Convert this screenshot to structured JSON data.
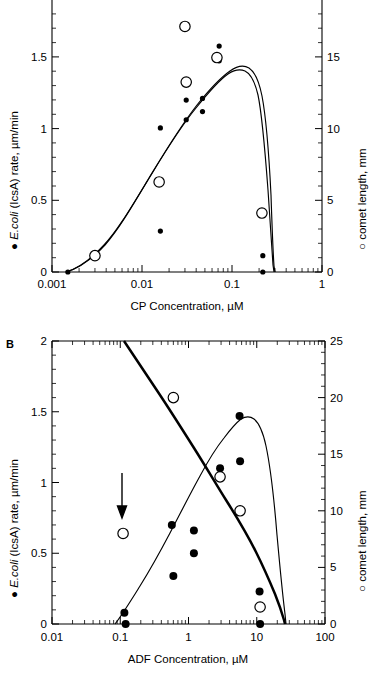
{
  "figure": {
    "panels": [
      {
        "letter": "",
        "id": "panel-a",
        "xlabel": "CP Concentration, µM",
        "ylabel_left_marker": "●",
        "ylabel_left_italic": "E.coli",
        "ylabel_left_rest": " (IcsA) rate,  µm/min",
        "ylabel_right_marker": "○",
        "ylabel_right_text": " comet length, mm",
        "x_ticks": [
          "0.001",
          "0.01",
          "0.1",
          "1"
        ],
        "y_left_ticks": [
          "0",
          "0.5",
          "1",
          "1.5"
        ],
        "y_right_ticks": [
          "0",
          "5",
          "10",
          "15"
        ]
      },
      {
        "letter": "B",
        "id": "panel-b",
        "xlabel": "ADF Concentration, µM",
        "ylabel_left_marker": "●",
        "ylabel_left_italic": "E.coli",
        "ylabel_left_rest": " (IcsA) rate,  µm/min",
        "ylabel_right_marker": "○",
        "ylabel_right_text": " comet length, mm",
        "x_ticks": [
          "0.01",
          "0.1",
          "1",
          "10",
          "100"
        ],
        "y_left_ticks": [
          "0",
          "0.5",
          "1",
          "1.5",
          "2"
        ],
        "y_right_ticks": [
          "0",
          "5",
          "10",
          "15",
          "20",
          "25"
        ]
      }
    ]
  },
  "chart_data": [
    {
      "type": "scatter",
      "id": "panel-a",
      "title": "",
      "xlabel": "CP Concentration, µM",
      "ylabel": "E.coli (IcsA) rate, µm/min",
      "ylabel_right": "comet length, mm",
      "xscale": "log",
      "xlim": [
        0.001,
        1
      ],
      "ylim": [
        0,
        1.75
      ],
      "ylim_right": [
        0,
        17.5
      ],
      "grid": false,
      "legend": [
        "● E.coli (IcsA) rate, µm/min",
        "○ comet length, mm"
      ],
      "series": [
        {
          "name": "E.coli (IcsA) rate",
          "marker": "filled-circle",
          "axis": "left",
          "points": [
            {
              "x": 0.0015,
              "y": 0.0
            },
            {
              "x": 0.016,
              "y": 0.88
            },
            {
              "x": 0.016,
              "y": 0.25
            },
            {
              "x": 0.031,
              "y": 1.05
            },
            {
              "x": 0.031,
              "y": 0.93
            },
            {
              "x": 0.047,
              "y": 1.06
            },
            {
              "x": 0.047,
              "y": 0.98
            },
            {
              "x": 0.072,
              "y": 1.38
            },
            {
              "x": 0.072,
              "y": 1.29
            },
            {
              "x": 0.22,
              "y": 0.1
            },
            {
              "x": 0.22,
              "y": 0.0
            }
          ]
        },
        {
          "name": "comet length",
          "marker": "open-circle",
          "axis": "right",
          "points": [
            {
              "x": 0.003,
              "y": 1.0
            },
            {
              "x": 0.0155,
              "y": 5.5
            },
            {
              "x": 0.03,
              "y": 15.0
            },
            {
              "x": 0.031,
              "y": 11.6
            },
            {
              "x": 0.068,
              "y": 13.1
            },
            {
              "x": 0.215,
              "y": 3.6
            }
          ]
        }
      ],
      "curves": [
        {
          "name": "rate-fit",
          "style": "thin",
          "description": "bell-shaped fit peaking near 0.07 µM at 1.45 µm/min, falling to 0 near 0.23 µM"
        },
        {
          "name": "comet-fit",
          "style": "thin",
          "description": "bell-shaped fit peaking near 0.075 µM at 13.2 mm, falling steeply to 0 near 0.23 µM"
        }
      ]
    },
    {
      "type": "scatter",
      "id": "panel-b",
      "title": "B",
      "xlabel": "ADF Concentration, µM",
      "ylabel": "E.coli (IcsA) rate, µm/min",
      "ylabel_right": "comet length, mm",
      "xscale": "log",
      "xlim": [
        0.01,
        100
      ],
      "ylim": [
        0,
        2
      ],
      "ylim_right": [
        0,
        25
      ],
      "grid": false,
      "legend": [
        "● E.coli (IcsA) rate, µm/min",
        "○ comet length, mm"
      ],
      "annotations": [
        {
          "type": "arrow",
          "x": 0.11,
          "y_from": 1.05,
          "y_to": 0.78,
          "label": ""
        }
      ],
      "series": [
        {
          "name": "E.coli (IcsA) rate",
          "marker": "filled-circle",
          "axis": "left",
          "points": [
            {
              "x": 0.115,
              "y": 0.08
            },
            {
              "x": 0.12,
              "y": 0.0
            },
            {
              "x": 0.57,
              "y": 0.7
            },
            {
              "x": 0.6,
              "y": 0.34
            },
            {
              "x": 1.2,
              "y": 0.66
            },
            {
              "x": 1.2,
              "y": 0.5
            },
            {
              "x": 2.9,
              "y": 1.1
            },
            {
              "x": 5.6,
              "y": 1.47
            },
            {
              "x": 5.7,
              "y": 1.15
            },
            {
              "x": 11.0,
              "y": 0.23
            },
            {
              "x": 11.2,
              "y": 0.0
            }
          ]
        },
        {
          "name": "comet length",
          "marker": "open-circle",
          "axis": "right",
          "points": [
            {
              "x": 0.11,
              "y": 8.0
            },
            {
              "x": 0.6,
              "y": 20.0
            },
            {
              "x": 2.9,
              "y": 13.0
            },
            {
              "x": 5.7,
              "y": 10.0
            },
            {
              "x": 11.2,
              "y": 1.5
            }
          ]
        }
      ],
      "curves": [
        {
          "name": "comet-fit",
          "style": "thick",
          "description": "monotonically decreasing from 25 mm at ~0.25 µM to 0 near 12 µM"
        },
        {
          "name": "rate-fit",
          "style": "thin",
          "description": "rises from 0 near 0.09 µM, peaks at ~1.49 µm/min near 4 µM, drops to 0 near 12 µM"
        }
      ]
    }
  ]
}
